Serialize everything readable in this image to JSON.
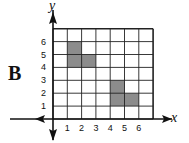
{
  "label": "B",
  "axes": {
    "x_label": "x",
    "y_label": "y"
  },
  "x_ticks": [
    "1",
    "2",
    "3",
    "4",
    "5",
    "6"
  ],
  "y_ticks": [
    "1",
    "2",
    "3",
    "4",
    "5",
    "6"
  ],
  "grid": {
    "min": 0,
    "max": 7
  },
  "shapes": [
    {
      "name": "shape-upper",
      "polygon": [
        [
          1,
          4
        ],
        [
          3,
          4
        ],
        [
          3,
          5
        ],
        [
          2,
          5
        ],
        [
          2,
          6
        ],
        [
          1,
          6
        ]
      ],
      "fill": "#8c8c8c"
    },
    {
      "name": "shape-lower",
      "polygon": [
        [
          4,
          1
        ],
        [
          6,
          1
        ],
        [
          6,
          2
        ],
        [
          5,
          2
        ],
        [
          5,
          3
        ],
        [
          4,
          3
        ]
      ],
      "fill": "#8c8c8c"
    }
  ],
  "colors": {
    "grid": "#222222",
    "axis": "#111111"
  }
}
